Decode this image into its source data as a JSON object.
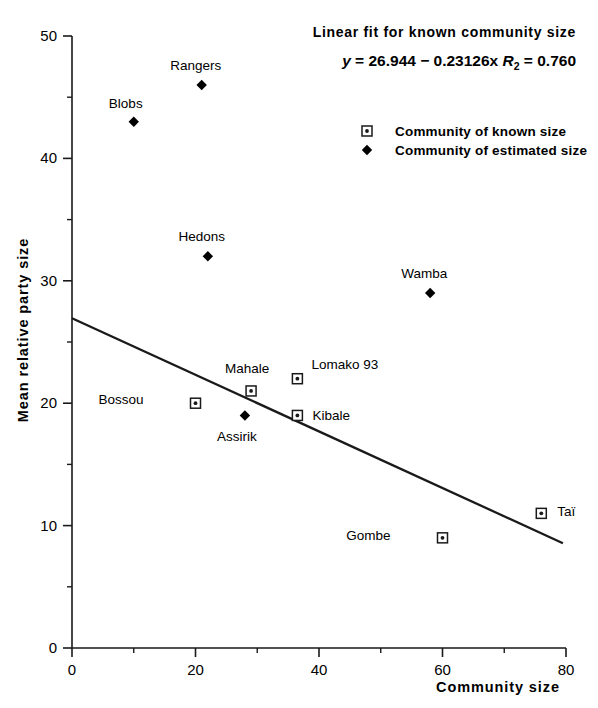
{
  "chart_data": {
    "type": "scatter",
    "title": "",
    "xlabel": "Community size",
    "ylabel": "Mean relative party size",
    "xlim": [
      0,
      80
    ],
    "ylim": [
      0,
      50
    ],
    "xticks": [
      "0",
      "20",
      "40",
      "60",
      "80"
    ],
    "xtick_values": [
      0,
      20,
      40,
      60,
      80
    ],
    "xminor_values": [
      10,
      30,
      50,
      70
    ],
    "yticks": [
      "0",
      "10",
      "20",
      "30",
      "40",
      "50"
    ],
    "ytick_values": [
      0,
      10,
      20,
      30,
      40,
      50
    ],
    "yminor_values": [
      5,
      15,
      25,
      35,
      45
    ],
    "grid": false,
    "legend_position": "upper-right",
    "legend": [
      {
        "key": "known",
        "marker": "open-square",
        "label": "Community of known size"
      },
      {
        "key": "estimated",
        "marker": "filled-diamond",
        "label": "Community of estimated size"
      }
    ],
    "annotations": {
      "fit_title": "Linear fit for known community size",
      "fit_equation_y": "y",
      "fit_equation_body": " = 26.944 − 0.23126x ",
      "fit_equation_r": "R",
      "fit_equation_r_sub": "2",
      "fit_equation_r_value": " = 0.760",
      "intercept": 26.944,
      "slope": -0.23126,
      "r_squared": 0.76
    },
    "fit_line": {
      "x_start": 0,
      "y_start": 26.944,
      "x_end": 79.5,
      "y_end": 8.56
    },
    "series": [
      {
        "name": "Community of known size",
        "marker": "open-square",
        "points": [
          {
            "label": "Bossou",
            "x": 20,
            "y": 20,
            "label_dx": -52,
            "label_dy": 1
          },
          {
            "label": "Mahale",
            "x": 29,
            "y": 21,
            "label_dx": -4,
            "label_dy": -18
          },
          {
            "label": "Lomako 93",
            "x": 36.5,
            "y": 22,
            "label_dx": 14,
            "label_dy": -10
          },
          {
            "label": "Kibale",
            "x": 36.5,
            "y": 19,
            "label_dx": 15,
            "label_dy": 5
          },
          {
            "label": "Gombe",
            "x": 60,
            "y": 9,
            "label_dx": -52,
            "label_dy": 2
          },
          {
            "label": "Taï",
            "x": 76,
            "y": 11,
            "label_dx": 16,
            "label_dy": 3
          }
        ]
      },
      {
        "name": "Community of estimated size",
        "marker": "filled-diamond",
        "points": [
          {
            "label": "Blobs",
            "x": 10,
            "y": 43,
            "label_dx": -8,
            "label_dy": -14
          },
          {
            "label": "Rangers",
            "x": 21,
            "y": 46,
            "label_dx": -6,
            "label_dy": -15
          },
          {
            "label": "Hedons",
            "x": 22,
            "y": 32,
            "label_dx": -6,
            "label_dy": -15
          },
          {
            "label": "Wamba",
            "x": 58,
            "y": 29,
            "label_dx": -6,
            "label_dy": -15
          },
          {
            "label": "Assirik",
            "x": 28,
            "y": 19,
            "label_dx": -8,
            "label_dy": 26
          }
        ]
      }
    ]
  }
}
